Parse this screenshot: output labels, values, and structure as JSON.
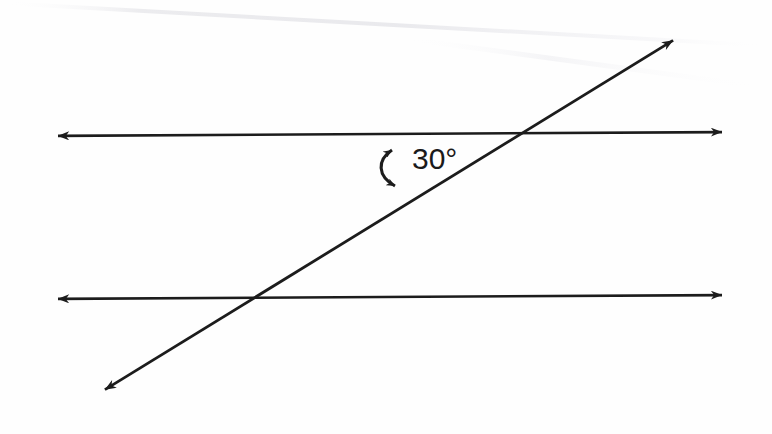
{
  "figure": {
    "background_color": "#fefefe",
    "ink_color": "#1c1c1c",
    "width": 772,
    "height": 434
  },
  "labels": {
    "angle_measure": "30°",
    "angle_value": 30,
    "angle_unit": "degrees"
  },
  "elements": {
    "upper_parallel_line": {
      "name": "upper-parallel-line",
      "x1": 45,
      "y1": 136,
      "x2": 735,
      "y2": 132,
      "arrowheads": "both",
      "stroke_width": 2.6
    },
    "lower_parallel_line": {
      "name": "lower-parallel-line",
      "x1": 45,
      "y1": 299,
      "x2": 735,
      "y2": 295,
      "arrowheads": "both",
      "stroke_width": 2.6
    },
    "transversal_line": {
      "name": "transversal-line",
      "x1": 93,
      "y1": 397,
      "x2": 685,
      "y2": 33,
      "arrowheads": "both",
      "stroke_width": 2.8,
      "slope": -0.615
    },
    "angle_arc": {
      "name": "angle-arc-double-arrow",
      "start_x": 392,
      "start_y": 143,
      "end_x": 395,
      "end_y": 192,
      "bow_x": 377,
      "arrowheads": "both"
    },
    "intersection_upper": {
      "x": 525,
      "y": 134
    },
    "intersection_lower": {
      "x": 248,
      "y": 297
    },
    "scan_streak": {
      "name": "scan-artifact-streak",
      "visible": true,
      "color": "#f2f2f4"
    }
  }
}
